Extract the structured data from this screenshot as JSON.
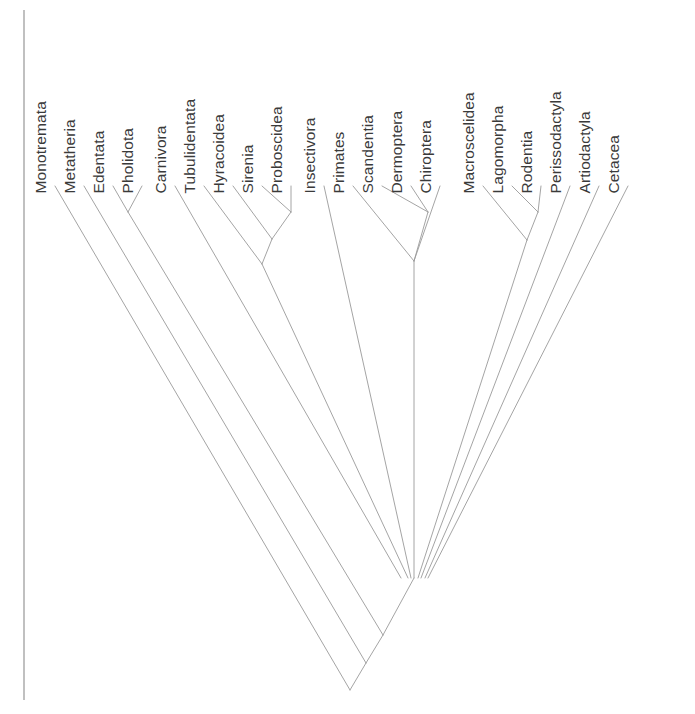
{
  "figure": {
    "kind": "cladogram",
    "background_color": "#ffffff",
    "line_color": "#9a9a9a",
    "border_line_color": "#8c8c8c",
    "label_color": "#3a3a3a",
    "label_orientation": "vertical-rotated-90",
    "label_baseline_y": 178,
    "tip_y": 186,
    "root_y": 690,
    "root_x": 350,
    "tip_spacing": 29
  },
  "taxa": [
    {
      "name": "Monotremata",
      "x": 55
    },
    {
      "name": "Metatheria",
      "x": 84
    },
    {
      "name": "Edentata",
      "x": 113
    },
    {
      "name": "Pholidota",
      "x": 142
    },
    {
      "name": "Carnivora",
      "x": 175
    },
    {
      "name": "Tubulidentata",
      "x": 204
    },
    {
      "name": "Hyracoidea",
      "x": 233
    },
    {
      "name": "Sirenia",
      "x": 262
    },
    {
      "name": "Proboscidea",
      "x": 291
    },
    {
      "name": "Insectivora",
      "x": 324
    },
    {
      "name": "Primates",
      "x": 353
    },
    {
      "name": "Scandentia",
      "x": 382
    },
    {
      "name": "Dermoptera",
      "x": 411
    },
    {
      "name": "Chiroptera",
      "x": 440
    },
    {
      "name": "Macroscelidea",
      "x": 483
    },
    {
      "name": "Lagomorpha",
      "x": 512
    },
    {
      "name": "Rodentia",
      "x": 541
    },
    {
      "name": "Perissodactyla",
      "x": 570
    },
    {
      "name": "Artiodactyla",
      "x": 599
    },
    {
      "name": "Cetacea",
      "x": 628
    }
  ],
  "label_offsets": [
    {
      "name": "Monotremata",
      "left": 48,
      "bottom": 178
    },
    {
      "name": "Metatheria",
      "left": 77,
      "bottom": 178
    },
    {
      "name": "Edentata",
      "left": 106,
      "bottom": 178
    },
    {
      "name": "Pholidota",
      "left": 135,
      "bottom": 178
    },
    {
      "name": "Carnivora",
      "left": 168,
      "bottom": 178
    },
    {
      "name": "Tubulidentata",
      "left": 197,
      "bottom": 178
    },
    {
      "name": "Hyracoidea",
      "left": 226,
      "bottom": 178
    },
    {
      "name": "Sirenia",
      "left": 255,
      "bottom": 178
    },
    {
      "name": "Proboscidea",
      "left": 284,
      "bottom": 178
    },
    {
      "name": "Insectivora",
      "left": 317,
      "bottom": 178
    },
    {
      "name": "Primates",
      "left": 346,
      "bottom": 178
    },
    {
      "name": "Scandentia",
      "left": 375,
      "bottom": 178
    },
    {
      "name": "Dermoptera",
      "left": 404,
      "bottom": 178
    },
    {
      "name": "Chiroptera",
      "left": 433,
      "bottom": 178
    },
    {
      "name": "Macroscelidea",
      "left": 476,
      "bottom": 178
    },
    {
      "name": "Lagomorpha",
      "left": 505,
      "bottom": 178
    },
    {
      "name": "Rodentia",
      "left": 534,
      "bottom": 178
    },
    {
      "name": "Perissodactyla",
      "left": 563,
      "bottom": 178
    },
    {
      "name": "Artiodactyla",
      "left": 592,
      "bottom": 178
    },
    {
      "name": "Cetacea",
      "left": 621,
      "bottom": 178
    }
  ],
  "branches": [
    {
      "id": "monotremata-stem",
      "x1": 55,
      "y1": 186,
      "x2": 350,
      "y2": 690
    },
    {
      "id": "metatheria-stem",
      "x1": 84,
      "y1": 186,
      "x2": 366,
      "y2": 663
    },
    {
      "id": "root-stem",
      "x1": 366,
      "y1": 663,
      "x2": 350,
      "y2": 690
    },
    {
      "id": "edentata-stem",
      "x1": 113,
      "y1": 186,
      "x2": 128,
      "y2": 212
    },
    {
      "id": "pholidota-stem",
      "x1": 142,
      "y1": 186,
      "x2": 128,
      "y2": 212
    },
    {
      "id": "xenarthra-stem",
      "x1": 128,
      "y1": 212,
      "x2": 383,
      "y2": 635
    },
    {
      "id": "metatheria-node",
      "x1": 383,
      "y1": 635,
      "x2": 366,
      "y2": 663
    },
    {
      "id": "carnivora-stem",
      "x1": 175,
      "y1": 186,
      "x2": 401,
      "y2": 578
    },
    {
      "id": "sirenia-stem",
      "x1": 262,
      "y1": 186,
      "x2": 291,
      "y2": 212
    },
    {
      "id": "proboscidea-stem",
      "x1": 291,
      "y1": 186,
      "x2": 291,
      "y2": 212
    },
    {
      "id": "tethytheria-stem",
      "x1": 291,
      "y1": 212,
      "x2": 272,
      "y2": 239
    },
    {
      "id": "hyracoidea-stem",
      "x1": 233,
      "y1": 186,
      "x2": 272,
      "y2": 239
    },
    {
      "id": "paenungulata-stem",
      "x1": 272,
      "y1": 239,
      "x2": 262,
      "y2": 264
    },
    {
      "id": "tubulidentata-stem",
      "x1": 204,
      "y1": 186,
      "x2": 262,
      "y2": 264
    },
    {
      "id": "afrotheria-stem",
      "x1": 262,
      "y1": 264,
      "x2": 408,
      "y2": 578
    },
    {
      "id": "insectivora-stem",
      "x1": 324,
      "y1": 186,
      "x2": 411,
      "y2": 578
    },
    {
      "id": "scandentia-stem",
      "x1": 382,
      "y1": 186,
      "x2": 428,
      "y2": 212
    },
    {
      "id": "dermoptera-stem",
      "x1": 411,
      "y1": 186,
      "x2": 428,
      "y2": 212
    },
    {
      "id": "sundatheria-stem",
      "x1": 428,
      "y1": 212,
      "x2": 414,
      "y2": 261
    },
    {
      "id": "primates-stem",
      "x1": 353,
      "y1": 186,
      "x2": 414,
      "y2": 261
    },
    {
      "id": "chiroptera-stem",
      "x1": 440,
      "y1": 186,
      "x2": 414,
      "y2": 261
    },
    {
      "id": "euarchonta-stem",
      "x1": 414,
      "y1": 261,
      "x2": 414,
      "y2": 578
    },
    {
      "id": "lagomorpha-stem",
      "x1": 512,
      "y1": 186,
      "x2": 538,
      "y2": 212
    },
    {
      "id": "rodentia-stem",
      "x1": 541,
      "y1": 186,
      "x2": 538,
      "y2": 212
    },
    {
      "id": "glires-stem",
      "x1": 538,
      "y1": 212,
      "x2": 527,
      "y2": 240
    },
    {
      "id": "macroscelidea-stem",
      "x1": 483,
      "y1": 186,
      "x2": 527,
      "y2": 240
    },
    {
      "id": "anagalida-stem",
      "x1": 527,
      "y1": 240,
      "x2": 418,
      "y2": 578
    },
    {
      "id": "perissodactyla-stem",
      "x1": 570,
      "y1": 186,
      "x2": 421,
      "y2": 578
    },
    {
      "id": "artiodactyla-stem",
      "x1": 599,
      "y1": 186,
      "x2": 425,
      "y2": 578
    },
    {
      "id": "cetacea-stem",
      "x1": 628,
      "y1": 186,
      "x2": 428,
      "y2": 578
    },
    {
      "id": "polytomy-stem",
      "x1": 414,
      "y1": 578,
      "x2": 383,
      "y2": 635
    }
  ],
  "border": {
    "x": 24,
    "y_top": 10,
    "y_bottom": 700
  }
}
